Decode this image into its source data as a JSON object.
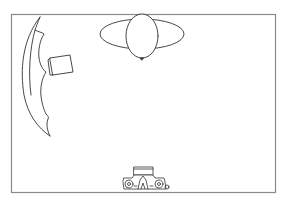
{
  "diagram": {
    "type": "studio-lighting-setup",
    "colors": {
      "background": "#ffffff",
      "line": "#333333",
      "frame": "#8a8a8a"
    },
    "elements": [
      {
        "id": "frame",
        "name": "studio-floor-frame"
      },
      {
        "id": "reflector",
        "name": "curved-reflector-left"
      },
      {
        "id": "light",
        "name": "softbox-light-left"
      },
      {
        "id": "subject",
        "name": "balloon-subject"
      },
      {
        "id": "backdrop",
        "name": "elliptical-backdrop"
      },
      {
        "id": "camera",
        "name": "camera-top-view"
      }
    ]
  }
}
